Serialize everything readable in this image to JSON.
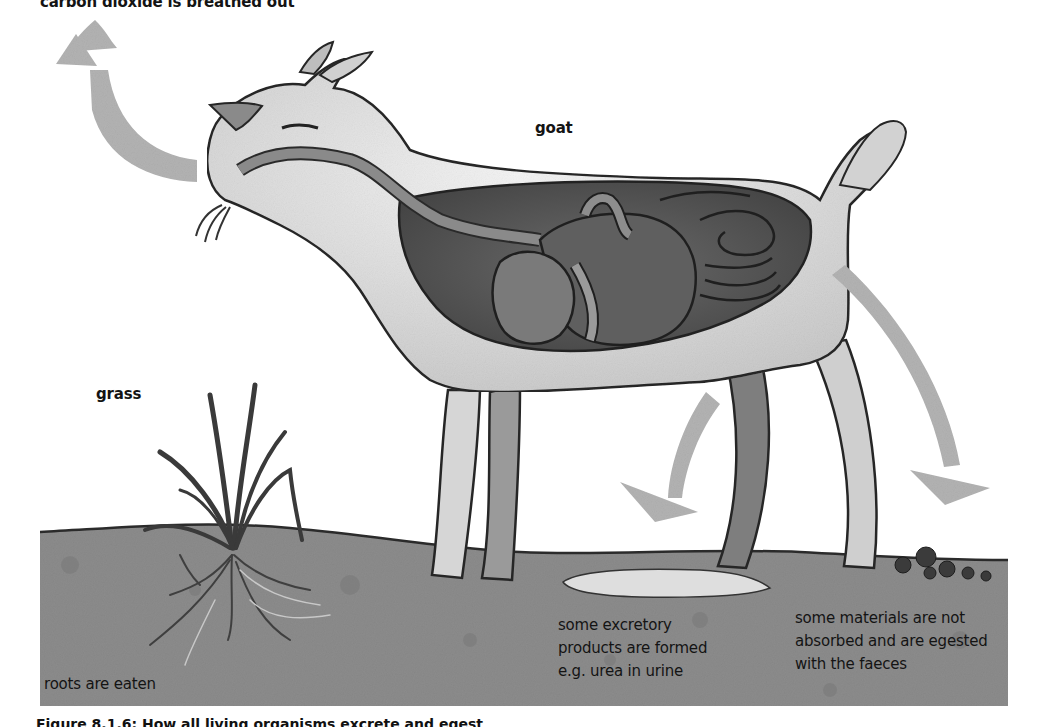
{
  "diagram": {
    "title_partial": "carbon dioxide is breathed out",
    "caption_partial": "Figure 8.1.6: How all living organisms excrete and egest",
    "labels": {
      "co2": "carbon dioxide is breathed out",
      "goat": "goat",
      "grass": "grass",
      "roots": "roots are eaten",
      "excretory": "some excretory\nproducts are formed\ne.g. urea in urine",
      "egested": "some materials are not\nabsorbed and are egested\nwith the faeces"
    },
    "arrows": [
      {
        "name": "co2-arrow",
        "direction": "up-curved",
        "meaning": "carbon dioxide breathed out"
      },
      {
        "name": "urine-arrow",
        "direction": "down-left-curved",
        "meaning": "excretion"
      },
      {
        "name": "faeces-arrow",
        "direction": "down-right-curved",
        "meaning": "egestion"
      }
    ],
    "colors": {
      "arrow": "#b3b3b3",
      "ground": "#8f8f8f",
      "gut_cavity": "#555555",
      "goat_body": "#e6e6e6",
      "outline": "#2a2a2a",
      "puddle": "#dcdcdc",
      "faeces": "#3a3a3a"
    }
  }
}
